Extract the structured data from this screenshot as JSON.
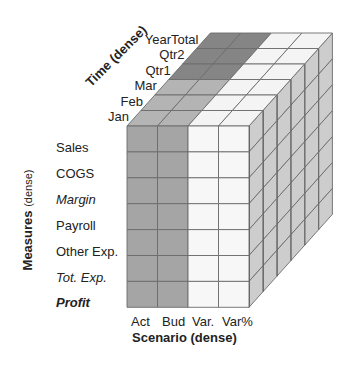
{
  "diagram": {
    "type": "multidimensional-cube",
    "axes": {
      "time": {
        "title": "Time",
        "qualifier": "(dense)",
        "members": [
          "Jan",
          "Feb",
          "Mar",
          "Qtr1",
          "Qtr2",
          "YearTotal"
        ]
      },
      "measures": {
        "title": "Measures",
        "qualifier": "(dense)",
        "members": [
          {
            "label": "Sales",
            "style": "normal"
          },
          {
            "label": "COGS",
            "style": "normal"
          },
          {
            "label": "Margin",
            "style": "italic"
          },
          {
            "label": "Payroll",
            "style": "normal"
          },
          {
            "label": "Other Exp.",
            "style": "normal"
          },
          {
            "label": "Tot. Exp.",
            "style": "italic"
          },
          {
            "label": "Profit",
            "style": "bold-italic"
          }
        ]
      },
      "scenario": {
        "title": "Scenario (dense)",
        "members": [
          "Act",
          "Bud",
          "Var.",
          "Var%"
        ]
      }
    },
    "colors": {
      "front_shaded": "#a5a5a5",
      "front_white": "#f7f7f7",
      "top_shaded": "#b4b4b4",
      "top_dark": "#858585",
      "top_white": "#f4f4f4",
      "side": "#cdcdcd",
      "grid": "#6b6b6b"
    },
    "shaded_columns": [
      0,
      1
    ],
    "dark_time_members": [
      3,
      4,
      5
    ]
  }
}
